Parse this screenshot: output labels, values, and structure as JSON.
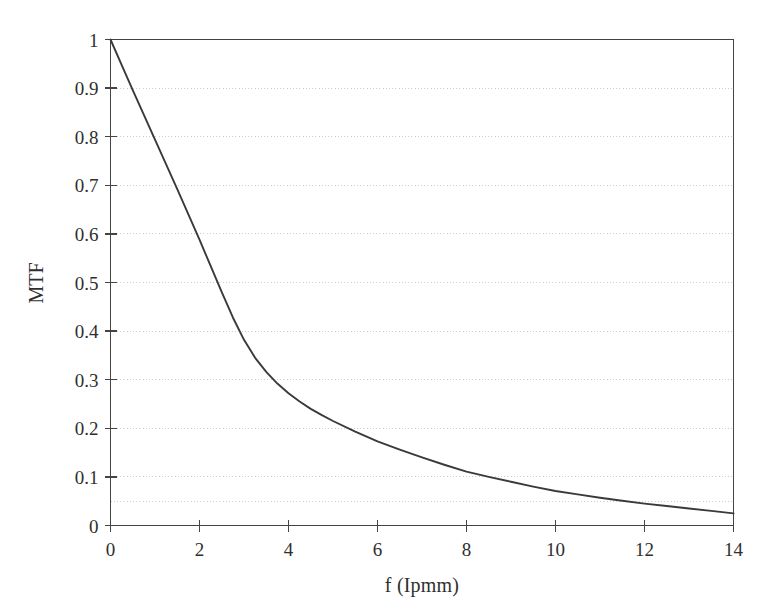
{
  "chart_data": {
    "type": "line",
    "title": "",
    "subtitle": "",
    "xlabel": "f (Ipmm)",
    "ylabel": "MTF",
    "xlim": [
      0,
      14
    ],
    "ylim": [
      0,
      1
    ],
    "grid": true,
    "grid_axis": "y",
    "legend": null,
    "legend_position": "none",
    "xticks": [
      0,
      2,
      4,
      6,
      8,
      10,
      12,
      14
    ],
    "xtick_labels": [
      "0",
      "2",
      "4",
      "6",
      "8",
      "10",
      "12",
      "14"
    ],
    "yticks": [
      0,
      0.1,
      0.2,
      0.3,
      0.4,
      0.5,
      0.6,
      0.7,
      0.8,
      0.9,
      1
    ],
    "ytick_labels": [
      "0",
      "0.1",
      "0.2",
      "0.3",
      "0.4",
      "0.5",
      "0.6",
      "0.7",
      "0.8",
      "0.9",
      "1"
    ],
    "gridline_values": [
      0.05,
      0.1,
      0.2,
      0.3,
      0.4,
      0.5,
      0.6,
      0.7,
      0.8,
      0.9
    ],
    "line_color": "#3a3a3a",
    "grid_color": "#c8c8d2",
    "axis_color": "#444444",
    "series": [
      {
        "name": "MTF",
        "x": [
          0,
          0.25,
          0.5,
          0.75,
          1,
          1.25,
          1.5,
          1.75,
          2,
          2.25,
          2.5,
          2.75,
          3,
          3.25,
          3.5,
          3.75,
          4,
          4.25,
          4.5,
          4.75,
          5,
          5.5,
          6,
          6.5,
          7,
          7.5,
          8,
          8.5,
          9,
          9.5,
          10,
          10.5,
          11,
          11.5,
          12,
          12.5,
          13,
          13.5,
          14
        ],
        "values": [
          1.0,
          0.948,
          0.896,
          0.845,
          0.794,
          0.743,
          0.692,
          0.64,
          0.588,
          0.534,
          0.48,
          0.428,
          0.382,
          0.345,
          0.316,
          0.292,
          0.272,
          0.255,
          0.24,
          0.227,
          0.215,
          0.193,
          0.173,
          0.156,
          0.14,
          0.125,
          0.111,
          0.1,
          0.09,
          0.08,
          0.071,
          0.064,
          0.057,
          0.051,
          0.045,
          0.04,
          0.035,
          0.03,
          0.025
        ]
      }
    ]
  },
  "axis_label_x": "f (Ipmm)",
  "axis_label_y": "MTF"
}
